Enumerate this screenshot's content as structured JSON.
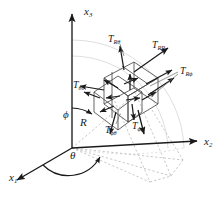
{
  "figure": {
    "type": "diagram",
    "background": "#ffffff",
    "line_color": "#1a1a1a",
    "dashed_color": "#b9b9b9"
  },
  "axes": [
    {
      "name": "x1-axis",
      "base": "x",
      "sub": "1",
      "x": 9,
      "y": 172
    },
    {
      "name": "x2-axis",
      "base": "x",
      "sub": "2",
      "x": 204,
      "y": 136
    },
    {
      "name": "x3-axis",
      "base": "x",
      "sub": "3",
      "x": 84,
      "y": 6
    }
  ],
  "angles": [
    {
      "name": "phi-angle",
      "symbol": "ϕ",
      "x": 63,
      "y": 109
    },
    {
      "name": "theta-angle",
      "symbol": "θ",
      "x": 70,
      "y": 150
    },
    {
      "name": "radius",
      "symbol": "R",
      "x": 80,
      "y": 117
    }
  ],
  "stress_labels": [
    {
      "name": "T-R-theta",
      "base": "T",
      "sub": "Rθ",
      "x": 108,
      "y": 34
    },
    {
      "name": "T-R-R",
      "base": "T",
      "sub": "RR",
      "x": 152,
      "y": 40
    },
    {
      "name": "T-R-phi",
      "base": "T",
      "sub": "Rϕ",
      "x": 180,
      "y": 66
    },
    {
      "name": "T-theta-theta",
      "base": "T",
      "sub": "θθ",
      "x": 73,
      "y": 80
    },
    {
      "name": "T-phi-theta",
      "base": "T",
      "sub": "ϕθ",
      "x": 105,
      "y": 125
    },
    {
      "name": "T-phi-phi",
      "base": "T",
      "sub": "ϕϕ",
      "x": 132,
      "y": 121
    }
  ],
  "geometry": {
    "origin": {
      "x": 72,
      "y": 148
    },
    "cube_center": {
      "x": 128,
      "y": 88
    },
    "arc_color": "#d0d0d0"
  }
}
